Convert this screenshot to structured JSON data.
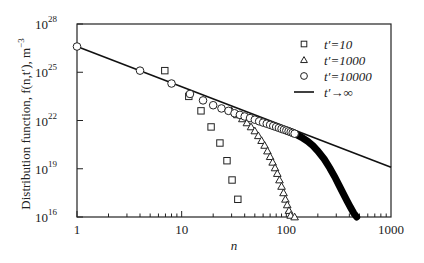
{
  "chart_data": {
    "type": "scatter",
    "title": "",
    "xlabel": "n",
    "ylabel": "Distribution function, f(n,t′), m⁻³",
    "xscale": "log",
    "yscale": "log",
    "xlim": [
      1,
      1000
    ],
    "ylim": [
      1e+16,
      1e+28
    ],
    "x_ticks": [
      {
        "value": 1,
        "label": "1"
      },
      {
        "value": 10,
        "label": "10"
      },
      {
        "value": 100,
        "label": "100"
      },
      {
        "value": 1000,
        "label": "1000"
      }
    ],
    "y_ticks": [
      {
        "exp": 16,
        "base": "10",
        "sup": "16"
      },
      {
        "exp": 19,
        "base": "10",
        "sup": "19"
      },
      {
        "exp": 22,
        "base": "10",
        "sup": "22"
      },
      {
        "exp": 25,
        "base": "10",
        "sup": "25"
      },
      {
        "exp": 28,
        "base": "10",
        "sup": "28"
      }
    ],
    "grid": false,
    "legend_position": "upper right",
    "series": [
      {
        "name": "t′=10",
        "marker": "square",
        "points_log10": [
          [
            6.9,
            25.1
          ],
          [
            11.7,
            23.5
          ],
          [
            15.3,
            22.6
          ],
          [
            19.1,
            21.6
          ],
          [
            23.2,
            20.6
          ],
          [
            27.1,
            19.5
          ],
          [
            30.3,
            18.3
          ],
          [
            34.4,
            17.1
          ]
        ]
      },
      {
        "name": "t′=1000",
        "marker": "triangle",
        "points_log10": [
          [
            30,
            22.6
          ],
          [
            34,
            22.35
          ],
          [
            38,
            22.1
          ],
          [
            42,
            21.85
          ],
          [
            46,
            21.6
          ],
          [
            50,
            21.35
          ],
          [
            54,
            21.05
          ],
          [
            58,
            20.75
          ],
          [
            62,
            20.45
          ],
          [
            66,
            20.1
          ],
          [
            70,
            19.75
          ],
          [
            74,
            19.4
          ],
          [
            78,
            19.05
          ],
          [
            82,
            18.7
          ],
          [
            86,
            18.3
          ],
          [
            90,
            17.9
          ],
          [
            94,
            17.5
          ],
          [
            98,
            17.1
          ],
          [
            102,
            16.75
          ],
          [
            106,
            16.4
          ],
          [
            110,
            16.1
          ],
          [
            114,
            15.9
          ],
          [
            120,
            16.0
          ]
        ]
      },
      {
        "name": "t′=10000",
        "marker": "circle",
        "points_log10": [
          [
            1,
            26.6
          ],
          [
            4,
            25.1
          ],
          [
            8,
            24.3
          ],
          [
            12,
            23.65
          ],
          [
            16,
            23.25
          ],
          [
            20,
            22.95
          ],
          [
            24,
            22.75
          ],
          [
            28,
            22.6
          ],
          [
            32,
            22.45
          ],
          [
            36,
            22.35
          ],
          [
            40,
            22.25
          ],
          [
            45,
            22.15
          ],
          [
            50,
            22.05
          ],
          [
            55,
            21.95
          ],
          [
            60,
            21.87
          ],
          [
            65,
            21.8
          ],
          [
            70,
            21.73
          ],
          [
            75,
            21.66
          ],
          [
            80,
            21.6
          ],
          [
            85,
            21.54
          ],
          [
            90,
            21.48
          ],
          [
            95,
            21.43
          ],
          [
            100,
            21.38
          ],
          [
            105,
            21.33
          ],
          [
            110,
            21.28
          ],
          [
            115,
            21.23
          ],
          [
            120,
            21.18
          ]
        ],
        "dense_tail": {
          "from_n": 120,
          "to_n": 470,
          "curve_log10": [
            [
              120,
              21.18
            ],
            [
              140,
              20.95
            ],
            [
              160,
              20.7
            ],
            [
              180,
              20.42
            ],
            [
              200,
              20.1
            ],
            [
              230,
              19.6
            ],
            [
              260,
              19.05
            ],
            [
              290,
              18.5
            ],
            [
              320,
              17.95
            ],
            [
              350,
              17.45
            ],
            [
              380,
              17.0
            ],
            [
              410,
              16.6
            ],
            [
              440,
              16.25
            ],
            [
              470,
              16.0
            ]
          ]
        }
      },
      {
        "name": "t′→∞",
        "marker": "line",
        "line_log10": [
          [
            1,
            26.6
          ],
          [
            1000,
            19.1
          ]
        ]
      }
    ]
  },
  "legend": {
    "items": [
      {
        "marker": "square",
        "label": "t′=10"
      },
      {
        "marker": "triangle",
        "label": "t′=1000"
      },
      {
        "marker": "circle",
        "label": "t′=10000"
      },
      {
        "marker": "line",
        "label": "t′→∞"
      }
    ]
  },
  "axes": {
    "xlabel": "n",
    "ylabel": "Distribution function, f(n,t′), m",
    "ylabel_sup": "−3"
  }
}
